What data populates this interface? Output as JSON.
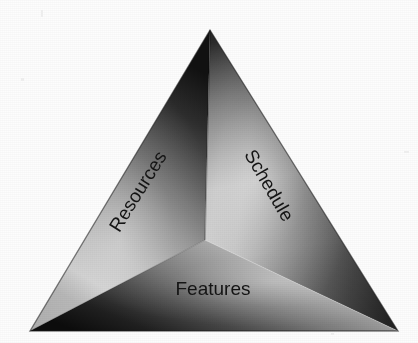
{
  "figure": {
    "background_color": "#fdfdfd",
    "shape": "triangle-pyramid",
    "faces": [
      {
        "id": "left",
        "label": "Resources",
        "rotation_deg": -58,
        "label_x": 139,
        "label_y": 192,
        "font_size": 19,
        "dark_color": "#1c1c1c",
        "mid_color": "#8a8a8a",
        "light_color": "#d8d8d8"
      },
      {
        "id": "right",
        "label": "Schedule",
        "rotation_deg": 60,
        "label_x": 268,
        "label_y": 186,
        "font_size": 19,
        "dark_color": "#262626",
        "mid_color": "#8f8f8f",
        "light_color": "#e4e4e4"
      },
      {
        "id": "bottom",
        "label": "Features",
        "rotation_deg": 0,
        "label_x": 213,
        "label_y": 290,
        "font_size": 19,
        "dark_color": "#101010",
        "mid_color": "#6d6d6d",
        "light_color": "#cfcfcf"
      }
    ],
    "geometry": {
      "apex": [
        210,
        30
      ],
      "bottom_left": [
        30,
        331
      ],
      "bottom_right": [
        398,
        331
      ],
      "center": [
        205,
        240
      ]
    },
    "label_color": "#141414"
  }
}
